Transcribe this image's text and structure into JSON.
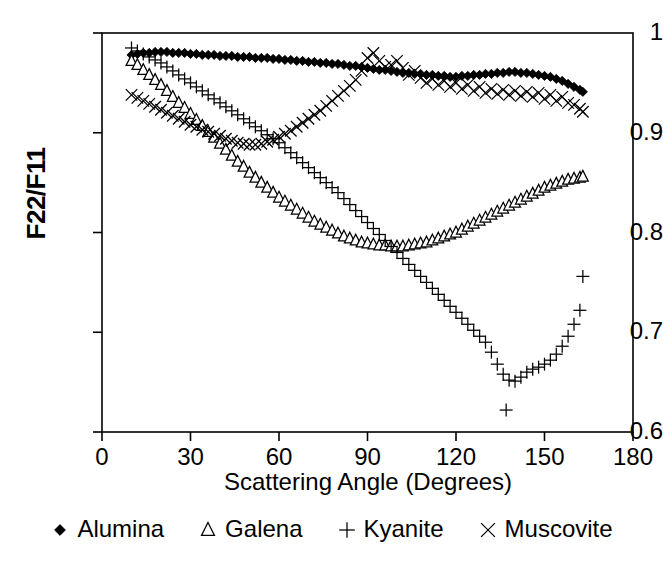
{
  "chart_data": {
    "type": "scatter",
    "title": "",
    "xlabel": "Scattering Angle (Degrees)",
    "ylabel": "F22/F11",
    "xlim": [
      0,
      180
    ],
    "ylim": [
      0.6,
      1.0
    ],
    "xticks": [
      0,
      30,
      60,
      90,
      120,
      150,
      180
    ],
    "yticks": [
      0.6,
      0.7,
      0.8,
      0.9,
      1
    ],
    "xtick_labels": [
      "0",
      "30",
      "60",
      "90",
      "120",
      "150",
      "180"
    ],
    "ytick_labels": [
      "0.6",
      "0.7",
      "0.8",
      "0.9",
      "1"
    ],
    "grid": false,
    "legend_position": "below",
    "series": [
      {
        "name": "Alumina",
        "marker": "filled-diamond",
        "color": "#000000",
        "x": [
          10,
          12,
          14,
          16,
          18,
          20,
          22,
          24,
          26,
          28,
          30,
          32,
          34,
          36,
          38,
          40,
          42,
          44,
          46,
          48,
          50,
          52,
          54,
          56,
          58,
          60,
          62,
          64,
          66,
          68,
          70,
          72,
          74,
          76,
          78,
          80,
          82,
          84,
          86,
          88,
          90,
          92,
          94,
          96,
          98,
          100,
          102,
          104,
          106,
          108,
          110,
          112,
          114,
          116,
          118,
          120,
          122,
          124,
          126,
          128,
          130,
          132,
          134,
          136,
          138,
          140,
          142,
          144,
          146,
          148,
          150,
          152,
          154,
          156,
          158,
          160,
          162,
          163
        ],
        "y": [
          0.978,
          0.979,
          0.98,
          0.98,
          0.981,
          0.981,
          0.981,
          0.98,
          0.98,
          0.98,
          0.979,
          0.979,
          0.978,
          0.978,
          0.978,
          0.977,
          0.977,
          0.977,
          0.976,
          0.976,
          0.976,
          0.975,
          0.975,
          0.975,
          0.974,
          0.974,
          0.973,
          0.973,
          0.972,
          0.972,
          0.971,
          0.971,
          0.97,
          0.97,
          0.969,
          0.969,
          0.968,
          0.967,
          0.967,
          0.966,
          0.965,
          0.964,
          0.963,
          0.963,
          0.962,
          0.961,
          0.96,
          0.96,
          0.959,
          0.959,
          0.958,
          0.958,
          0.957,
          0.957,
          0.956,
          0.956,
          0.957,
          0.957,
          0.958,
          0.958,
          0.959,
          0.959,
          0.96,
          0.96,
          0.961,
          0.961,
          0.96,
          0.96,
          0.959,
          0.958,
          0.957,
          0.956,
          0.954,
          0.952,
          0.949,
          0.946,
          0.943,
          0.941
        ]
      },
      {
        "name": "Galena",
        "marker": "open-triangle",
        "color": "#000000",
        "x": [
          10,
          12,
          14,
          16,
          18,
          20,
          22,
          24,
          26,
          28,
          30,
          32,
          34,
          36,
          38,
          40,
          42,
          44,
          46,
          48,
          50,
          52,
          54,
          56,
          58,
          60,
          62,
          64,
          66,
          68,
          70,
          72,
          74,
          76,
          78,
          80,
          82,
          84,
          86,
          88,
          90,
          92,
          94,
          96,
          98,
          100,
          102,
          104,
          106,
          108,
          110,
          112,
          114,
          116,
          118,
          120,
          122,
          124,
          126,
          128,
          130,
          132,
          134,
          136,
          138,
          140,
          142,
          144,
          146,
          148,
          150,
          152,
          154,
          156,
          158,
          160,
          162,
          163
        ],
        "y": [
          0.972,
          0.968,
          0.963,
          0.958,
          0.953,
          0.948,
          0.942,
          0.936,
          0.93,
          0.925,
          0.919,
          0.913,
          0.907,
          0.901,
          0.895,
          0.889,
          0.883,
          0.877,
          0.871,
          0.866,
          0.86,
          0.855,
          0.85,
          0.845,
          0.84,
          0.835,
          0.831,
          0.827,
          0.823,
          0.819,
          0.815,
          0.811,
          0.808,
          0.805,
          0.802,
          0.799,
          0.796,
          0.794,
          0.792,
          0.79,
          0.789,
          0.788,
          0.787,
          0.787,
          0.786,
          0.786,
          0.786,
          0.787,
          0.788,
          0.789,
          0.79,
          0.792,
          0.794,
          0.796,
          0.798,
          0.8,
          0.803,
          0.806,
          0.809,
          0.812,
          0.815,
          0.818,
          0.821,
          0.824,
          0.827,
          0.83,
          0.833,
          0.836,
          0.839,
          0.842,
          0.845,
          0.847,
          0.849,
          0.851,
          0.853,
          0.854,
          0.855,
          0.856
        ]
      },
      {
        "name": "Kyanite",
        "marker": "plus",
        "color": "#000000",
        "x": [
          10,
          12,
          14,
          16,
          18,
          20,
          22,
          24,
          26,
          28,
          30,
          32,
          34,
          36,
          38,
          40,
          42,
          44,
          46,
          48,
          50,
          52,
          54,
          56,
          58,
          60,
          62,
          64,
          66,
          68,
          70,
          72,
          74,
          76,
          78,
          80,
          82,
          84,
          86,
          88,
          90,
          92,
          94,
          96,
          98,
          100,
          102,
          104,
          106,
          108,
          110,
          112,
          114,
          116,
          118,
          120,
          122,
          124,
          126,
          128,
          130,
          132,
          134,
          136,
          137,
          138,
          140,
          142,
          144,
          146,
          148,
          150,
          152,
          154,
          156,
          158,
          160,
          162,
          163
        ],
        "y": [
          0.985,
          0.982,
          0.979,
          0.976,
          0.973,
          0.97,
          0.966,
          0.962,
          0.958,
          0.954,
          0.95,
          0.946,
          0.942,
          0.938,
          0.934,
          0.93,
          0.926,
          0.922,
          0.918,
          0.914,
          0.91,
          0.906,
          0.902,
          0.898,
          0.894,
          0.89,
          0.885,
          0.88,
          0.875,
          0.87,
          0.865,
          0.86,
          0.855,
          0.85,
          0.845,
          0.84,
          0.834,
          0.828,
          0.822,
          0.816,
          0.81,
          0.804,
          0.798,
          0.792,
          0.786,
          0.78,
          0.774,
          0.768,
          0.762,
          0.756,
          0.75,
          0.744,
          0.738,
          0.732,
          0.726,
          0.72,
          0.714,
          0.708,
          0.702,
          0.696,
          0.69,
          0.68,
          0.668,
          0.658,
          0.622,
          0.652,
          0.651,
          0.655,
          0.66,
          0.663,
          0.665,
          0.668,
          0.672,
          0.678,
          0.686,
          0.696,
          0.708,
          0.722,
          0.756
        ]
      },
      {
        "name": "Muscovite",
        "marker": "cross",
        "color": "#000000",
        "x": [
          10,
          12,
          14,
          16,
          18,
          20,
          22,
          24,
          26,
          28,
          30,
          32,
          34,
          36,
          38,
          40,
          42,
          44,
          46,
          48,
          50,
          52,
          54,
          56,
          58,
          60,
          62,
          64,
          66,
          68,
          70,
          72,
          74,
          76,
          78,
          80,
          82,
          84,
          86,
          88,
          90,
          92,
          94,
          96,
          98,
          100,
          102,
          104,
          106,
          108,
          110,
          112,
          114,
          116,
          118,
          120,
          122,
          124,
          126,
          128,
          130,
          132,
          134,
          136,
          138,
          140,
          142,
          144,
          146,
          148,
          150,
          152,
          154,
          156,
          158,
          160,
          162,
          163
        ],
        "y": [
          0.938,
          0.935,
          0.932,
          0.929,
          0.926,
          0.923,
          0.92,
          0.917,
          0.914,
          0.911,
          0.908,
          0.906,
          0.903,
          0.901,
          0.899,
          0.897,
          0.894,
          0.892,
          0.89,
          0.889,
          0.888,
          0.888,
          0.889,
          0.891,
          0.893,
          0.896,
          0.899,
          0.902,
          0.906,
          0.91,
          0.914,
          0.918,
          0.922,
          0.927,
          0.932,
          0.937,
          0.942,
          0.947,
          0.953,
          0.962,
          0.975,
          0.98,
          0.972,
          0.966,
          0.968,
          0.972,
          0.965,
          0.958,
          0.962,
          0.955,
          0.95,
          0.954,
          0.948,
          0.952,
          0.946,
          0.95,
          0.944,
          0.948,
          0.942,
          0.946,
          0.94,
          0.944,
          0.939,
          0.943,
          0.938,
          0.942,
          0.937,
          0.941,
          0.936,
          0.94,
          0.934,
          0.938,
          0.932,
          0.936,
          0.93,
          0.928,
          0.924,
          0.921
        ]
      }
    ]
  },
  "legend": {
    "items": [
      {
        "label": "Alumina",
        "marker": "filled-diamond"
      },
      {
        "label": "Galena",
        "marker": "open-triangle"
      },
      {
        "label": "Kyanite",
        "marker": "plus"
      },
      {
        "label": "Muscovite",
        "marker": "cross"
      }
    ]
  }
}
